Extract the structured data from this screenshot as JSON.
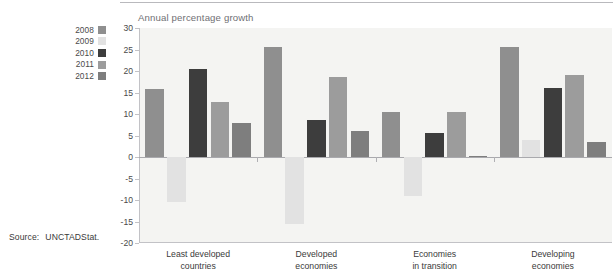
{
  "source": {
    "label": "Source:",
    "value": "UNCTADStat."
  },
  "legend": {
    "items": [
      {
        "label": "2008",
        "color": "#8f8f8f"
      },
      {
        "label": "2009",
        "color": "#e2e2e2"
      },
      {
        "label": "2010",
        "color": "#3d3d3d"
      },
      {
        "label": "2011",
        "color": "#9c9c9c"
      },
      {
        "label": "2012",
        "color": "#7e7e7e"
      }
    ]
  },
  "chart_data": {
    "type": "bar",
    "title": "Annual percentage growth",
    "xlabel": "",
    "ylabel": "",
    "ylim": [
      -20,
      30
    ],
    "yticks": [
      30,
      25,
      20,
      15,
      10,
      5,
      0,
      -5,
      -10,
      -15,
      -20
    ],
    "ytick_labels": [
      "30",
      "25",
      "20",
      "15",
      "10",
      "5",
      "0",
      "-5",
      "-10",
      "-15",
      "-20"
    ],
    "grid": false,
    "legend_position": "left-outside",
    "categories": [
      "Least developed\ncountries",
      "Developed\neconomies",
      "Economies\nin transition",
      "Developing\neconomies"
    ],
    "series": [
      {
        "name": "2008",
        "color": "#8f8f8f",
        "values": [
          15.8,
          25.5,
          10.5,
          25.5
        ]
      },
      {
        "name": "2009",
        "color": "#e2e2e2",
        "values": [
          -10.5,
          -15.5,
          -9.0,
          4.0
        ]
      },
      {
        "name": "2010",
        "color": "#3d3d3d",
        "values": [
          20.5,
          8.5,
          5.5,
          16.0
        ]
      },
      {
        "name": "2011",
        "color": "#9c9c9c",
        "values": [
          12.8,
          18.5,
          10.5,
          19.0
        ]
      },
      {
        "name": "2012",
        "color": "#7e7e7e",
        "values": [
          7.8,
          6.0,
          0.3,
          3.5
        ]
      }
    ]
  }
}
